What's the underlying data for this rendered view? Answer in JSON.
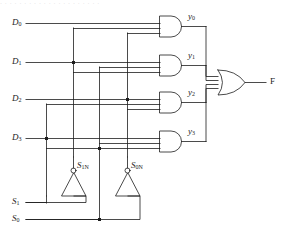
{
  "figure": {
    "kind": "logic-circuit-diagram",
    "top_text_fragment": "· · · · · · · · · · · · · · · · · · · · ·",
    "stroke_color": "#1d1d1d",
    "background_color": "#ffffff"
  },
  "data_inputs": [
    {
      "label": "D",
      "sub": "0",
      "name": "d0"
    },
    {
      "label": "D",
      "sub": "1",
      "name": "d1"
    },
    {
      "label": "D",
      "sub": "2",
      "name": "d2"
    },
    {
      "label": "D",
      "sub": "3",
      "name": "d3"
    }
  ],
  "select_inputs": [
    {
      "label": "S",
      "sub": "1",
      "name": "s1"
    },
    {
      "label": "S",
      "sub": "0",
      "name": "s0"
    }
  ],
  "inverters": [
    {
      "label": "S",
      "sub": "1N",
      "name": "s1n"
    },
    {
      "label": "S",
      "sub": "0N",
      "name": "s0n"
    }
  ],
  "and_gate_outputs": [
    {
      "label": "y",
      "sub": "0",
      "name": "y0"
    },
    {
      "label": "y",
      "sub": "1",
      "name": "y1"
    },
    {
      "label": "y",
      "sub": "2",
      "name": "y2"
    },
    {
      "label": "y",
      "sub": "3",
      "name": "y3"
    }
  ],
  "or_gate_output": {
    "label": "F",
    "name": "f"
  },
  "gates": {
    "and_count": 4,
    "and_inputs_each": 3,
    "or_count": 1,
    "or_inputs": 4,
    "inverter_count": 2
  }
}
